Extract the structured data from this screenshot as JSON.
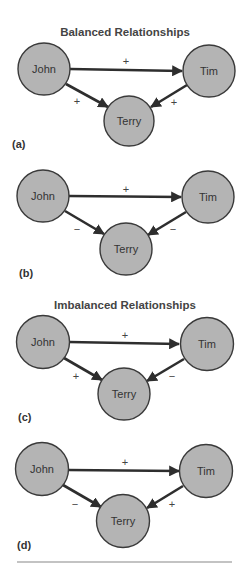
{
  "titles": {
    "balanced": "Balanced Relationships",
    "imbalanced": "Imbalanced Relationships"
  },
  "panels": [
    {
      "label": "(a)",
      "nodes": {
        "john": "John",
        "tim": "Tim",
        "terry": "Terry"
      },
      "signs": {
        "john_tim": "+",
        "john_terry": "+",
        "tim_terry": "+"
      }
    },
    {
      "label": "(b)",
      "nodes": {
        "john": "John",
        "tim": "Tim",
        "terry": "Terry"
      },
      "signs": {
        "john_tim": "+",
        "john_terry": "−",
        "tim_terry": "−"
      }
    },
    {
      "label": "(c)",
      "nodes": {
        "john": "John",
        "tim": "Tim",
        "terry": "Terry"
      },
      "signs": {
        "john_tim": "+",
        "john_terry": "+",
        "tim_terry": "−"
      }
    },
    {
      "label": "(d)",
      "nodes": {
        "john": "John",
        "tim": "Tim",
        "terry": "Terry"
      },
      "signs": {
        "john_tim": "+",
        "john_terry": "−",
        "tim_terry": "+"
      }
    }
  ],
  "colors": {
    "node_fill": "#b4b4b4",
    "node_stroke": "#3a3a3a",
    "edge": "#2e2e2e",
    "rule": "#888888"
  }
}
